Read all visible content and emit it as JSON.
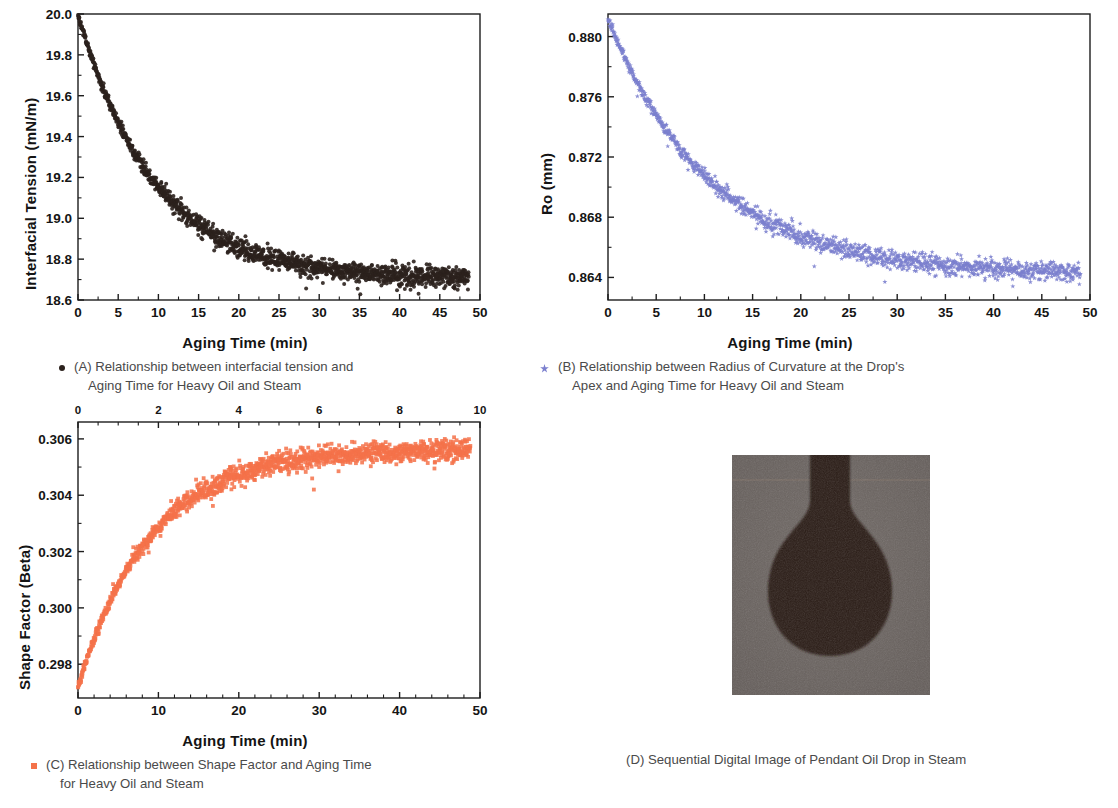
{
  "figure": {
    "background_color": "#ffffff"
  },
  "panels": [
    {
      "id": "A",
      "caption_line1": "(A) Relationship between interfacial tension and",
      "caption_line2": "Aging Time for Heavy Oil and Steam",
      "legend_marker": "filled-circle",
      "marker_color": "#2b211d"
    },
    {
      "id": "B",
      "caption_line1": "(B) Relationship between Radius of Curvature at the Drop's",
      "caption_line2": "Apex and Aging Time for Heavy Oil and Steam",
      "legend_marker": "star",
      "marker_color": "#7b7fce"
    },
    {
      "id": "C",
      "caption_line1": "(C) Relationship between Shape Factor and Aging Time",
      "caption_line2": "for Heavy Oil and Steam",
      "legend_marker": "filled-square",
      "marker_color": "#f4724a"
    },
    {
      "id": "D",
      "caption_line1": "(D) Sequential Digital Image of Pendant Oil Drop in Steam",
      "caption_line2": "",
      "legend_marker": "none",
      "marker_color": "#6a6360"
    }
  ],
  "chart_data": [
    {
      "panel": "A",
      "type": "scatter",
      "title": "",
      "xlabel": "Aging Time (min)",
      "ylabel": "Interfacial Tension (mN/m)",
      "xlim": [
        0,
        50
      ],
      "ylim": [
        18.6,
        20.0
      ],
      "xticks": [
        0,
        5,
        10,
        15,
        20,
        25,
        30,
        35,
        40,
        45,
        50
      ],
      "xtick_labels": [
        "0",
        "5",
        "10",
        "15",
        "20",
        "25",
        "30",
        "35",
        "40",
        "45",
        "50"
      ],
      "yticks": [
        18.6,
        18.8,
        19.0,
        19.2,
        19.4,
        19.6,
        19.8,
        20.0
      ],
      "ytick_labels": [
        "18.6",
        "18.8",
        "19.0",
        "19.2",
        "19.4",
        "19.6",
        "19.8",
        "20.0"
      ],
      "grid": false,
      "legend": "none",
      "marker": "circle",
      "marker_color": "#2b211d",
      "model": {
        "kind": "exponential_decay",
        "y0": 20.0,
        "y_inf": 18.7,
        "tau": 9.5,
        "noise": 0.018,
        "n_points": 1450
      },
      "series": [
        {
          "name": "Interfacial Tension",
          "x": [
            0,
            1,
            2,
            3,
            4,
            5,
            7.5,
            10,
            12.5,
            15,
            17.5,
            20,
            25,
            30,
            35,
            40,
            45,
            48.5
          ],
          "values": [
            20.0,
            19.78,
            19.6,
            19.45,
            19.33,
            19.23,
            19.06,
            18.96,
            18.92,
            18.87,
            18.84,
            18.81,
            18.78,
            18.76,
            18.74,
            18.72,
            18.71,
            18.7
          ]
        }
      ]
    },
    {
      "panel": "B",
      "type": "scatter",
      "title": "",
      "xlabel": "Aging Time (min)",
      "ylabel": "Ro (mm)",
      "xlim": [
        0,
        50
      ],
      "ylim": [
        0.8625,
        0.8815
      ],
      "xticks": [
        0,
        5,
        10,
        15,
        20,
        25,
        30,
        35,
        40,
        45,
        50
      ],
      "xtick_labels": [
        "0",
        "5",
        "10",
        "15",
        "20",
        "25",
        "30",
        "35",
        "40",
        "45",
        "50"
      ],
      "yticks": [
        0.864,
        0.868,
        0.872,
        0.876,
        0.88
      ],
      "ytick_labels": [
        "0.864",
        "0.868",
        "0.872",
        "0.876",
        "0.880"
      ],
      "grid": false,
      "legend": "none",
      "marker": "star",
      "marker_color": "#7b7fce",
      "model": {
        "kind": "exponential_decay",
        "y0": 0.8812,
        "y_inf": 0.8642,
        "tau": 10.5,
        "noise": 0.00022,
        "n_points": 1400
      },
      "series": [
        {
          "name": "Radius of Curvature at Apex",
          "x": [
            0,
            1,
            2,
            3,
            5,
            7.5,
            10,
            12.5,
            15,
            20,
            25,
            30,
            35,
            40,
            45,
            49
          ],
          "values": [
            0.8812,
            0.8795,
            0.8778,
            0.8765,
            0.8742,
            0.8718,
            0.87,
            0.8688,
            0.8678,
            0.8666,
            0.8657,
            0.8652,
            0.8648,
            0.8646,
            0.8644,
            0.8643
          ]
        }
      ]
    },
    {
      "panel": "C",
      "type": "scatter",
      "title": "",
      "xlabel": "Aging Time (min)",
      "ylabel": "Shape Factor (Beta)",
      "xlim": [
        0,
        50
      ],
      "ylim": [
        0.2968,
        0.3066
      ],
      "xticks": [
        0,
        10,
        20,
        30,
        40,
        50
      ],
      "xtick_labels": [
        "0",
        "10",
        "20",
        "30",
        "40",
        "50"
      ],
      "top_xticks": [
        0,
        2,
        4,
        6,
        8,
        10
      ],
      "top_xtick_labels": [
        "0",
        "2",
        "4",
        "6",
        "8",
        "10"
      ],
      "yticks": [
        0.298,
        0.3,
        0.302,
        0.304,
        0.306
      ],
      "ytick_labels": [
        "0.298",
        "0.300",
        "0.302",
        "0.304",
        "0.306"
      ],
      "grid": false,
      "legend": "none",
      "marker": "square",
      "marker_color": "#f4724a",
      "model": {
        "kind": "exponential_rise",
        "y0": 0.2972,
        "y_inf": 0.30565,
        "tau": 9.0,
        "noise": 0.00013,
        "n_points": 1400
      },
      "series": [
        {
          "name": "Shape Factor (Beta)",
          "x": [
            0,
            1,
            2,
            3,
            5,
            7.5,
            10,
            12.5,
            15,
            20,
            25,
            30,
            35,
            40,
            45,
            49
          ],
          "values": [
            0.2972,
            0.2991,
            0.30055,
            0.3017,
            0.3033,
            0.3044,
            0.305,
            0.30528,
            0.30542,
            0.30552,
            0.30557,
            0.3056,
            0.30562,
            0.30563,
            0.30564,
            0.30565
          ]
        }
      ]
    },
    {
      "panel": "D",
      "type": "image",
      "title": "Sequential Digital Image of Pendant Oil Drop in Steam",
      "description": "Grayscale photograph of a dark pendant oil drop hanging from a needle against a gray steam background",
      "background_gray": "#6a6360",
      "drop_color": "#2b1d16"
    }
  ]
}
